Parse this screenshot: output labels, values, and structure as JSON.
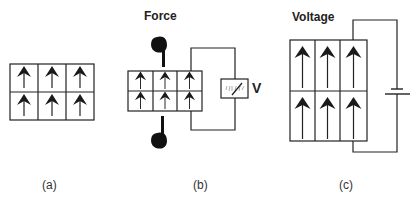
{
  "panels": [
    {
      "id": "a",
      "caption": "(a)",
      "title": ""
    },
    {
      "id": "b",
      "caption": "(b)",
      "title": "Force",
      "meter_label": "V"
    },
    {
      "id": "c",
      "caption": "(c)",
      "title": "Voltage"
    }
  ],
  "grid": {
    "rows": 2,
    "cols": 3,
    "arrow_direction": "up"
  },
  "colors": {
    "line": "#222222",
    "fill": "#ffffff",
    "arrow": "#1a1a1a",
    "hand": "#111111"
  },
  "icons": {
    "arrow": "up-arrow-icon",
    "hand_top": "pointing-hand-down-icon",
    "hand_bottom": "pointing-hand-up-icon",
    "meter": "voltmeter-icon",
    "battery": "battery-icon"
  }
}
